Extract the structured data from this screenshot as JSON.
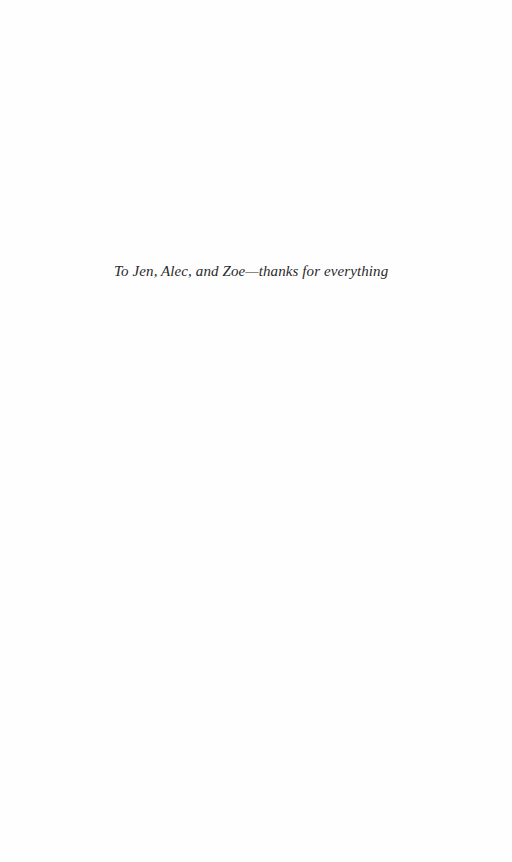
{
  "page": {
    "dedication": "To Jen, Alec, and Zoe—thanks for everything"
  }
}
